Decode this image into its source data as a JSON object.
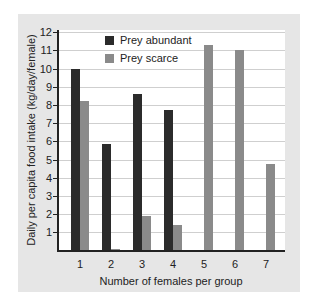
{
  "chart_data": {
    "type": "bar",
    "title": "",
    "xlabel": "Number of females per group",
    "ylabel": "Daily per capita food intake (kg/day/female)",
    "categories": [
      "1",
      "2",
      "3",
      "4",
      "5",
      "6",
      "7"
    ],
    "series": [
      {
        "name": "Prey abundant",
        "color": "#2b2b2b",
        "values": [
          10.0,
          5.85,
          8.6,
          7.7,
          0,
          0,
          0
        ]
      },
      {
        "name": "Prey scarce",
        "color": "#8a8a8a",
        "values": [
          8.2,
          0.1,
          1.9,
          1.4,
          11.3,
          11.0,
          4.75
        ]
      }
    ],
    "ylim": [
      0,
      12
    ],
    "yticks": [
      "1",
      "2",
      "3",
      "4",
      "5",
      "6",
      "7",
      "8",
      "9",
      "10",
      "11",
      "12"
    ],
    "grid": true,
    "legend_position": "upper left inside plot"
  },
  "legend": {
    "abundant": "Prey abundant",
    "scarce": "Prey scarce"
  },
  "axes": {
    "xlabel": "Number of females per group",
    "ylabel": "Daily per capita food intake (kg/day/female)"
  }
}
